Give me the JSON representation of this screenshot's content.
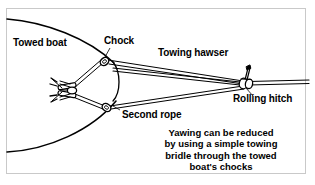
{
  "figure": {
    "type": "technical-illustration",
    "background_color": "#ffffff",
    "line_color": "#000000",
    "frame_color": "#c9c9c9"
  },
  "labels": {
    "towed_boat": "Towed boat",
    "chock": "Chock",
    "towing_hawser": "Towing hawser",
    "rolling_hitch": "Rolling hitch",
    "second_rope": "Second rope"
  },
  "caption": {
    "line1": "Yawing can be reduced",
    "line2": "by using a simple towing",
    "line3": "bridle through the towed",
    "line4": "boat's chocks"
  },
  "parts": {
    "hull": "boat-hull-bow-outline",
    "upper_chock": "upper-chock",
    "lower_chock": "lower-chock",
    "cleat": "deck-cleat-with-rope-turns",
    "bridle_leg_upper": "upper-bridle-leg",
    "bridle_leg_lower": "lower-bridle-leg",
    "hitch_knot": "rolling-hitch-knot",
    "hawser": "towing-hawser-line"
  }
}
